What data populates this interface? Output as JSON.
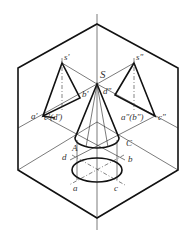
{
  "figure": {
    "type": "projection-diagram",
    "labels": {
      "apex": "S",
      "front_apex": "s'",
      "side_apex": "s\"",
      "top_apex": "s",
      "front_a": "a'",
      "front_b": "b'",
      "front_cd": "c'(d')",
      "side_d": "d\"",
      "side_ab": "a\"(b\")",
      "side_c": "c\"",
      "base_A": "A",
      "base_C": "C",
      "top_a": "a",
      "top_b": "b",
      "top_c": "c",
      "top_d": "d"
    }
  }
}
